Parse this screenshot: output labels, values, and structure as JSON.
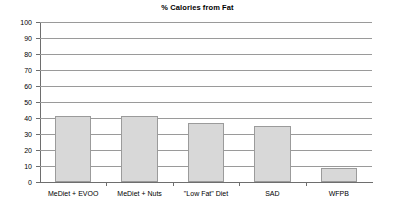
{
  "chart_data": {
    "type": "bar",
    "title": "% Calories from Fat",
    "xlabel": "",
    "ylabel": "",
    "categories": [
      "MeDiet + EVOO",
      "MeDiet + Nuts",
      "\"Low Fat\" Diet",
      "SAD",
      "WFPB"
    ],
    "values": [
      41,
      41,
      37,
      35,
      9
    ],
    "ylim": [
      0,
      100
    ],
    "ytick_labels": [
      "0",
      "10",
      "20",
      "30",
      "40",
      "50",
      "60",
      "70",
      "80",
      "90",
      "100"
    ],
    "ytick_values": [
      0,
      10,
      20,
      30,
      40,
      50,
      60,
      70,
      80,
      90,
      100
    ],
    "grid": true,
    "legend": false,
    "bar_color": "#d8d8d8",
    "bar_border_color": "#9b9b9b",
    "grid_color": "#9a9a9a",
    "axis_color": "#6e6e6e",
    "text_color": "#000000",
    "background": "#ffffff"
  }
}
